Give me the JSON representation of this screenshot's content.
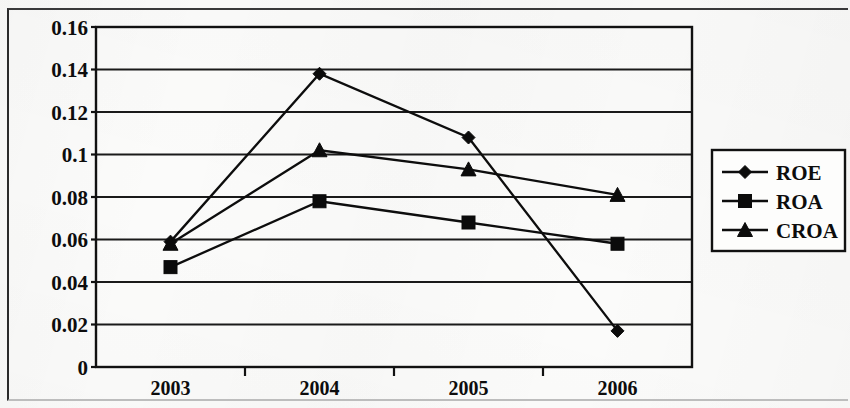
{
  "chart_data": {
    "type": "line",
    "title": "",
    "xlabel": "",
    "ylabel": "",
    "categories": [
      "2003",
      "2004",
      "2005",
      "2006"
    ],
    "ylim": [
      0,
      0.16
    ],
    "yticks": [
      0,
      0.02,
      0.04,
      0.06,
      0.08,
      0.1,
      0.12,
      0.14,
      0.16
    ],
    "ytick_labels": [
      "0",
      "0.02",
      "0.04",
      "0.06",
      "0.08",
      "0.1",
      "0.12",
      "0.14",
      "0.16"
    ],
    "grid": "horizontal",
    "legend_position": "right",
    "series": [
      {
        "name": "ROE",
        "marker": "diamond",
        "values": [
          0.059,
          0.138,
          0.108,
          0.017
        ]
      },
      {
        "name": "ROA",
        "marker": "square",
        "values": [
          0.047,
          0.078,
          0.068,
          0.058
        ]
      },
      {
        "name": "CROA",
        "marker": "triangle",
        "values": [
          0.058,
          0.102,
          0.093,
          0.081
        ]
      }
    ],
    "colors": {
      "series": "#0d0d0d",
      "grid": "#1a1a1a",
      "axis": "#111111"
    }
  },
  "legend": {
    "items": [
      {
        "label": "ROE",
        "marker": "diamond"
      },
      {
        "label": "ROA",
        "marker": "square"
      },
      {
        "label": "CROA",
        "marker": "triangle"
      }
    ]
  }
}
